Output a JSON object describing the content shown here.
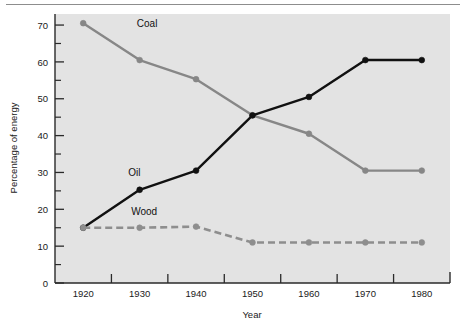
{
  "chart_data": {
    "type": "line",
    "title": "",
    "xlabel": "Year",
    "ylabel": "Percentage of energy",
    "x": [
      1920,
      1930,
      1940,
      1950,
      1960,
      1970,
      1980
    ],
    "xtick_labels": [
      "1920",
      "1930",
      "1940",
      "1950",
      "1960",
      "1970",
      "1980"
    ],
    "ytick_labels": [
      "0",
      "10",
      "20",
      "30",
      "40",
      "50",
      "60",
      "70"
    ],
    "yticks": [
      0,
      10,
      20,
      30,
      40,
      50,
      60,
      70
    ],
    "yminor_ticks": [
      5,
      15,
      25,
      35,
      45,
      55,
      65
    ],
    "xminor_ticks": [
      1925,
      1935,
      1945,
      1955,
      1965,
      1975
    ],
    "xlim": [
      1915,
      1985
    ],
    "ylim": [
      0,
      73
    ],
    "grid": false,
    "legend_position": "inline-annotations",
    "series": [
      {
        "name": "Coal",
        "color": "#878787",
        "style": "solid",
        "marker": "circle",
        "values": [
          70.5,
          60.5,
          55.3,
          45.5,
          40.5,
          30.5,
          30.5
        ],
        "label_text": "Coal",
        "label_x": 1929.5,
        "label_y": 69.5
      },
      {
        "name": "Oil",
        "color": "#111111",
        "style": "solid",
        "marker": "circle",
        "values": [
          15.0,
          25.3,
          30.5,
          45.5,
          50.5,
          60.5,
          60.5
        ],
        "label_text": "Oil",
        "label_x": 1928.0,
        "label_y": 29.0
      },
      {
        "name": "Wood",
        "color": "#8e8e8e",
        "style": "dashed",
        "marker": "circle",
        "values": [
          15.0,
          15.0,
          15.3,
          11.0,
          11.0,
          11.0,
          11.0
        ],
        "label_text": "Wood",
        "label_x": 1928.5,
        "label_y": 18.5
      }
    ],
    "plot_background": "#e3e3e3",
    "axis_color": "#2a2a2a"
  }
}
